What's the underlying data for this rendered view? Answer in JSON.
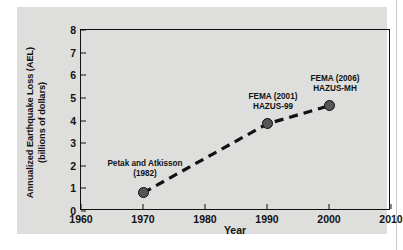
{
  "figure": {
    "panel_color": "#dededc",
    "page_color": "#ffffff"
  },
  "chart_data": {
    "type": "line",
    "title": "",
    "xlabel": "Year",
    "ylabel_line1": "Annualized Earthquake Loss (AEL)",
    "ylabel_line2": "(billions of dollars)",
    "xlim": [
      1960,
      2010
    ],
    "ylim": [
      0,
      8
    ],
    "xticks": [
      1960,
      1970,
      1980,
      1990,
      2000,
      2010
    ],
    "xtick_labels": [
      "1960",
      "1970",
      "1980",
      "1990",
      "2000",
      "2010"
    ],
    "yticks": [
      0,
      1,
      2,
      3,
      4,
      5,
      6,
      7,
      8
    ],
    "ytick_labels": [
      "0",
      "1",
      "2",
      "3",
      "4",
      "5",
      "6",
      "7",
      "8"
    ],
    "grid": false,
    "legend": "none",
    "line_style": "dashed",
    "line_color": "#111111",
    "marker_color": "#555555",
    "marker_edge_color": "#0d0d0d",
    "x": [
      1970,
      1990,
      2000
    ],
    "values": [
      0.8,
      3.85,
      4.65
    ],
    "points": [
      {
        "x": 1970,
        "y": 0.8,
        "label_line1": "Petak and Atkisson",
        "label_line2": "(1982)"
      },
      {
        "x": 1990,
        "y": 3.85,
        "label_line1": "FEMA (2001)",
        "label_line2": "HAZUS-99"
      },
      {
        "x": 2000,
        "y": 4.65,
        "label_line1": "FEMA (2006)",
        "label_line2": "HAZUS-MH"
      }
    ]
  }
}
